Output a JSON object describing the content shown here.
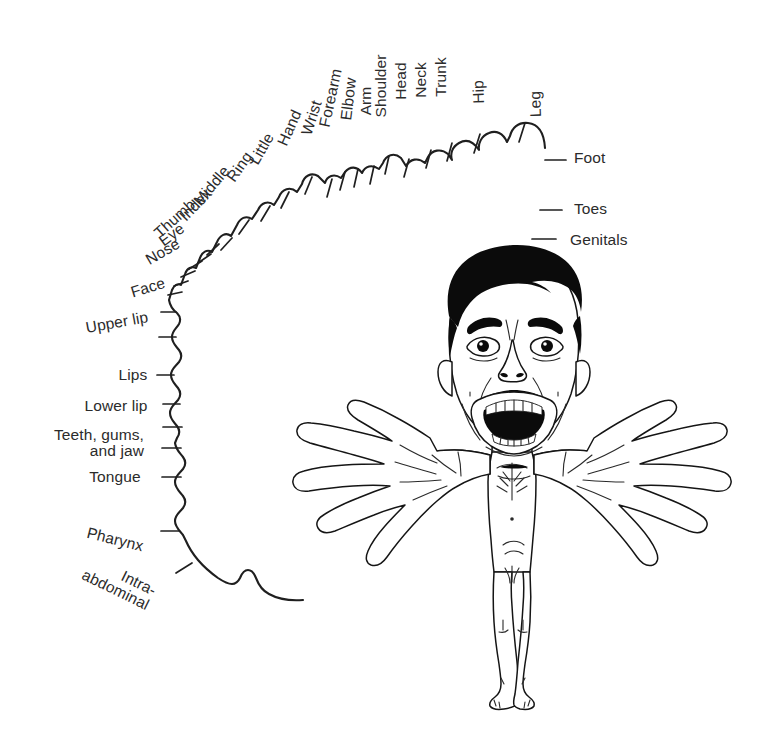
{
  "figure": {
    "kind": "sensory-homunculus-diagram",
    "background_color": "#ffffff",
    "line_color": "#1f1f1f",
    "label_color": "#2b2b2b",
    "hair_color": "#0b0b0b"
  },
  "arc_labels": [
    {
      "id": "leg",
      "text": "Leg",
      "x": 536,
      "y": 104,
      "rotate": -92,
      "anchor": "center"
    },
    {
      "id": "hip",
      "text": "Hip",
      "x": 479,
      "y": 92,
      "rotate": -92,
      "anchor": "center"
    },
    {
      "id": "trunk",
      "text": "Trunk",
      "x": 441,
      "y": 77,
      "rotate": -90,
      "anchor": "center"
    },
    {
      "id": "neck",
      "text": "Neck",
      "x": 421,
      "y": 80,
      "rotate": -90,
      "anchor": "center"
    },
    {
      "id": "head",
      "text": "Head",
      "x": 401,
      "y": 81,
      "rotate": -90,
      "anchor": "center"
    },
    {
      "id": "shoulder",
      "text": "Shoulder",
      "x": 381,
      "y": 86,
      "rotate": -90,
      "anchor": "center"
    },
    {
      "id": "arm",
      "text": "Arm",
      "x": 366,
      "y": 101,
      "rotate": -90,
      "anchor": "center"
    },
    {
      "id": "elbow",
      "text": "Elbow",
      "x": 349,
      "y": 99,
      "rotate": -83,
      "anchor": "center"
    },
    {
      "id": "forearm",
      "text": "Forearm",
      "x": 331,
      "y": 98,
      "rotate": -78,
      "anchor": "center"
    },
    {
      "id": "wrist",
      "text": "Wrist",
      "x": 312,
      "y": 118,
      "rotate": -72,
      "anchor": "center"
    },
    {
      "id": "hand",
      "text": "Hand",
      "x": 290,
      "y": 128,
      "rotate": -66,
      "anchor": "center"
    },
    {
      "id": "little",
      "text": "Little",
      "x": 262,
      "y": 149,
      "rotate": -60,
      "anchor": "center"
    },
    {
      "id": "ring",
      "text": "Ring",
      "x": 240,
      "y": 167,
      "rotate": -55,
      "anchor": "center"
    },
    {
      "id": "middle",
      "text": "Middle",
      "x": 212,
      "y": 186,
      "rotate": -50,
      "anchor": "center"
    },
    {
      "id": "index",
      "text": "Index",
      "x": 196,
      "y": 205,
      "rotate": -46,
      "anchor": "center"
    },
    {
      "id": "thumb",
      "text": "Thumb",
      "x": 175,
      "y": 219,
      "rotate": -42,
      "anchor": "center"
    },
    {
      "id": "eye",
      "text": "Eye",
      "x": 172,
      "y": 235,
      "rotate": -36,
      "anchor": "center"
    },
    {
      "id": "nose",
      "text": "Nose",
      "x": 163,
      "y": 252,
      "rotate": -30,
      "anchor": "center"
    },
    {
      "id": "face",
      "text": "Face",
      "x": 148,
      "y": 288,
      "rotate": -17,
      "anchor": "center"
    },
    {
      "id": "upper-lip",
      "text": "Upper lip",
      "x": 117,
      "y": 323,
      "rotate": -10,
      "anchor": "center"
    },
    {
      "id": "lips",
      "text": "Lips",
      "x": 133,
      "y": 375,
      "rotate": 0,
      "anchor": "center"
    },
    {
      "id": "lower-lip",
      "text": "Lower lip",
      "x": 116,
      "y": 406,
      "rotate": 0,
      "anchor": "center"
    },
    {
      "id": "teeth-gums-jaw",
      "text": "Teeth, gums,\nand jaw",
      "x": 99,
      "y": 443,
      "rotate": 0,
      "anchor": "center"
    },
    {
      "id": "tongue",
      "text": "Tongue",
      "x": 115,
      "y": 477,
      "rotate": 0,
      "anchor": "center"
    },
    {
      "id": "pharynx",
      "text": "Pharynx",
      "x": 115,
      "y": 540,
      "rotate": 14,
      "anchor": "center"
    },
    {
      "id": "intra-abdominal",
      "text": "Intra-\nabdominal",
      "x": 119,
      "y": 583,
      "rotate": 26,
      "anchor": "center"
    },
    {
      "id": "foot",
      "text": "Foot",
      "x": 574,
      "y": 158,
      "rotate": 0,
      "anchor": "left"
    },
    {
      "id": "toes",
      "text": "Toes",
      "x": 574,
      "y": 209,
      "rotate": 0,
      "anchor": "left"
    },
    {
      "id": "genitals",
      "text": "Genitals",
      "x": 570,
      "y": 240,
      "rotate": 0,
      "anchor": "left"
    }
  ],
  "homunculus": {
    "description": "Distorted human figure with oversized head, face and hands; small trunk, arms and legs",
    "parts": [
      "hair",
      "face",
      "eyes",
      "nose",
      "open-mouth",
      "teeth",
      "ears",
      "left-hand",
      "right-hand",
      "torso",
      "legs",
      "feet"
    ]
  }
}
